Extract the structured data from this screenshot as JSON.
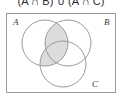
{
  "figure": {
    "caption": "(A ∩ B) ∪ (A ∩ C)",
    "type": "venn-diagram",
    "set_count": 3
  },
  "universe": {
    "label": "",
    "border_color": "#9a9a9a",
    "fill_color": "#ffffff",
    "x": 6,
    "y": 13,
    "width": 110,
    "height": 80
  },
  "sets": [
    {
      "name": "A",
      "label": "A",
      "label_position": "top-left",
      "cx": 45,
      "cy": 43,
      "r": 23,
      "stroke": "#9a9a9a"
    },
    {
      "name": "B",
      "label": "B",
      "label_position": "top-right",
      "cx": 68,
      "cy": 43,
      "r": 23,
      "stroke": "#9a9a9a"
    },
    {
      "name": "C",
      "label": "C",
      "label_position": "bottom-right",
      "cx": 63,
      "cy": 64,
      "r": 23,
      "stroke": "#9a9a9a"
    }
  ],
  "shading": {
    "fill_color": "#dcdcdc",
    "shaded_regions": [
      "A∩B",
      "A∩C",
      "A∩B∩C"
    ],
    "unshaded_regions": [
      "A only",
      "B only",
      "C only",
      "B∩C only",
      "outside"
    ]
  }
}
